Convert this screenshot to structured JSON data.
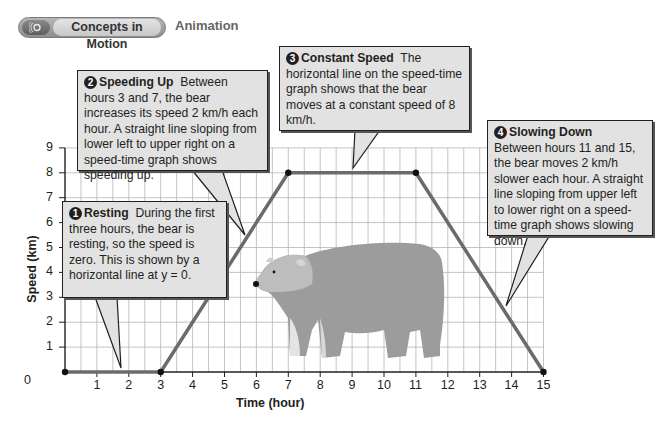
{
  "header": {
    "badge_label": "Concepts in Motion",
    "badge_icon": "motion-rings-icon",
    "section_label": "Animation"
  },
  "callouts": [
    {
      "number": "1",
      "title": "Resting",
      "text": "During the first three hours, the bear is resting, so the speed is zero. This is shown by a horizontal line at y = 0."
    },
    {
      "number": "2",
      "title": "Speeding Up",
      "text": "Between hours 3 and 7, the bear increases its speed 2 km/h each hour. A straight line sloping from lower left to upper right on a speed-time graph shows speeding up."
    },
    {
      "number": "3",
      "title": "Constant Speed",
      "text": "The horizontal line on the speed-time graph shows that the bear moves at a constant speed of 8 km/h."
    },
    {
      "number": "4",
      "title": "Slowing Down",
      "text": "Between hours 11 and 15, the bear moves 2 km/h slower each hour. A straight line sloping from upper left to lower right on a speed-time graph shows slowing down."
    }
  ],
  "axes": {
    "x_title": "Time (hour)",
    "y_title": "Speed (km)",
    "x_ticks": [
      "1",
      "2",
      "3",
      "4",
      "5",
      "6",
      "7",
      "8",
      "9",
      "10",
      "11",
      "12",
      "13",
      "14",
      "15"
    ],
    "y_ticks": [
      "0",
      "1",
      "2",
      "3",
      "4",
      "5",
      "6",
      "7",
      "8",
      "9"
    ]
  },
  "image": {
    "subject": "polar bear"
  },
  "colors": {
    "line": "#6b6b6b",
    "grid": "#b5b5b5",
    "callout_bg": "#e2e2e2",
    "point": "#111111"
  },
  "chart_data": {
    "type": "line",
    "title": "",
    "xlabel": "Time (hour)",
    "ylabel": "Speed (km)",
    "xlim": [
      0,
      15
    ],
    "ylim": [
      0,
      9
    ],
    "grid": true,
    "x_ticks": [
      1,
      2,
      3,
      4,
      5,
      6,
      7,
      8,
      9,
      10,
      11,
      12,
      13,
      14,
      15
    ],
    "y_ticks": [
      0,
      1,
      2,
      3,
      4,
      5,
      6,
      7,
      8,
      9
    ],
    "series": [
      {
        "name": "Bear speed",
        "x": [
          0,
          3,
          7,
          11,
          15
        ],
        "y": [
          0,
          0,
          8,
          8,
          0
        ]
      }
    ],
    "marked_points": [
      [
        0,
        0
      ],
      [
        3,
        0
      ],
      [
        7,
        8
      ],
      [
        11,
        8
      ],
      [
        15,
        0
      ]
    ],
    "annotations": [
      "1 Resting: hours 0-3, speed 0",
      "2 Speeding Up: hours 3-7, +2 km/h each hour",
      "3 Constant Speed: hours 7-11, 8 km/h",
      "4 Slowing Down: hours 11-15, -2 km/h each hour"
    ],
    "legend": null
  }
}
